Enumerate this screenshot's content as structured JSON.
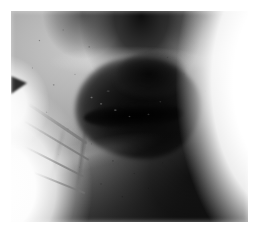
{
  "page": {
    "background_color": "#ffffff",
    "width": 260,
    "height": 235
  },
  "photo": {
    "kind": "clinical-photograph",
    "color_mode": "grayscale",
    "frame": {
      "left": 11,
      "top": 11,
      "width": 237,
      "height": 211
    },
    "subject": "close-up view from below of a chin, lower lip and submental neck",
    "caption": "",
    "regions": [
      {
        "name": "nostrils-and-under-nose",
        "tone": "#101010",
        "position": "top-center"
      },
      {
        "name": "upper-lip-ridge",
        "tone": "#b4b4b4",
        "position": "upper-center"
      },
      {
        "name": "crusted-lesion",
        "tone": "#0a0a0a",
        "position": "center"
      },
      {
        "name": "lesion-fissure",
        "tone": "#000000",
        "position": "center"
      },
      {
        "name": "left-cheek-skin",
        "tone": "#b8b8b8",
        "position": "left"
      },
      {
        "name": "submental-neck",
        "tone": "#6b6b6b",
        "position": "lower-center"
      },
      {
        "name": "right-neck-shadow",
        "tone": "#151515",
        "position": "right"
      },
      {
        "name": "white-background",
        "tone": "#ffffff",
        "position": "right-and-lower-left"
      },
      {
        "name": "hair-strands",
        "tone": "#8c8c8c",
        "position": "lower-left"
      },
      {
        "name": "hair-tuft-wedge",
        "tone": "#2b2b2b",
        "position": "left-edge"
      }
    ],
    "palette": {
      "highlight": "#ffffff",
      "skin_light": "#c9c9c9",
      "skin_mid": "#a2a2a2",
      "skin_dark": "#6d6d6d",
      "shadow": "#151515",
      "lesion": "#0a0a0a",
      "black": "#000000"
    }
  }
}
